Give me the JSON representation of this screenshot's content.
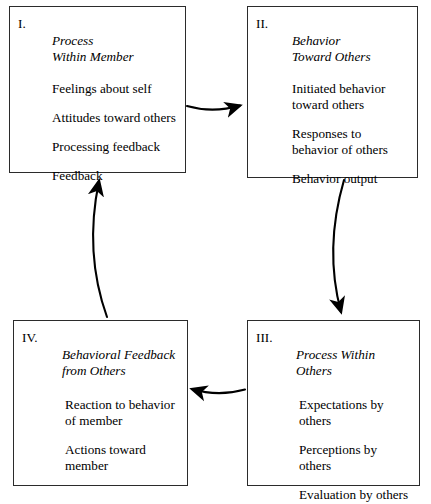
{
  "diagram": {
    "boxes": [
      {
        "numeral": "I.",
        "title": "Process\nWithin Member",
        "items": [
          "Feelings about self",
          "Attitudes toward others",
          "Processing feedback",
          "Feedback"
        ]
      },
      {
        "numeral": "II.",
        "title": "Behavior\nToward Others",
        "items": [
          "Initiated behavior\ntoward others",
          "Responses to\nbehavior of others",
          "Behavior output"
        ]
      },
      {
        "numeral": "III.",
        "title": "Process Within\nOthers",
        "items": [
          "Expectations by\nothers",
          "Perceptions by\nothers",
          "Evaluation by others"
        ]
      },
      {
        "numeral": "IV.",
        "title": "Behavioral Feedback\nfrom Others",
        "items": [
          "Reaction to behavior\nof member",
          "Actions toward\nmember"
        ]
      }
    ],
    "arrows": [
      {
        "name": "arrow-box1-to-box2",
        "from": "I",
        "to": "II",
        "direction": "right"
      },
      {
        "name": "arrow-box2-to-box3",
        "from": "II",
        "to": "III",
        "direction": "down"
      },
      {
        "name": "arrow-box3-to-box4",
        "from": "III",
        "to": "IV",
        "direction": "left"
      },
      {
        "name": "arrow-box4-to-box1",
        "from": "IV",
        "to": "I",
        "direction": "up"
      }
    ],
    "colors": {
      "stroke": "#2b2b2b",
      "arrow": "#000000",
      "background": "#ffffff"
    }
  }
}
